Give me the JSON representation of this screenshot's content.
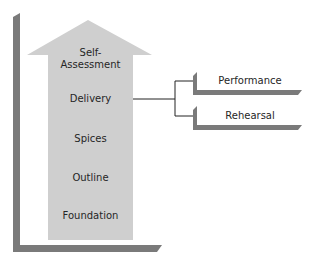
{
  "diagram": {
    "arrow_steps": [
      {
        "label": "Self-\nAssessment",
        "line1": "Self-",
        "line2": "Assessment"
      },
      {
        "label": "Delivery"
      },
      {
        "label": "Spices"
      },
      {
        "label": "Outline"
      },
      {
        "label": "Foundation"
      }
    ],
    "branches": [
      {
        "label": "Performance"
      },
      {
        "label": "Rehearsal"
      }
    ],
    "colors": {
      "arrow_fill": "#cfcfcf",
      "frame": "#7a7a7a",
      "connector": "#222222"
    }
  }
}
